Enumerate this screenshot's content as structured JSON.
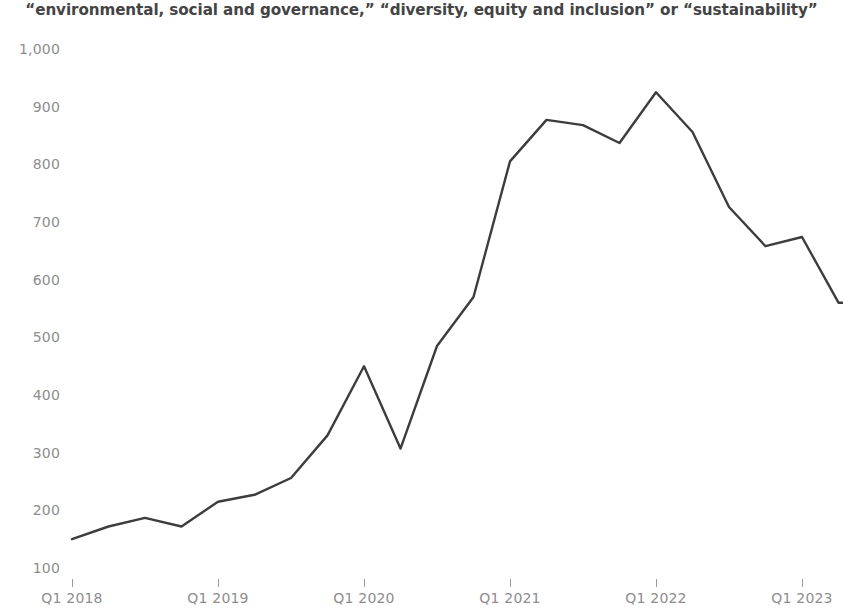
{
  "chart_data": {
    "type": "line",
    "title": "“environmental, social and governance,” “diversity, equity and inclusion” or “sustainability”",
    "subtitle": "",
    "xlabel": "",
    "ylabel": "",
    "ylim": [
      100,
      1000
    ],
    "grid": false,
    "legend": "none",
    "line_color": "#3d3d3d",
    "text_color": "#8d8d8d",
    "title_color": "#444444",
    "y_ticks": [
      "1,000",
      "900",
      "800",
      "700",
      "600",
      "500",
      "400",
      "300",
      "200",
      "100"
    ],
    "y_tick_values": [
      1000,
      900,
      800,
      700,
      600,
      500,
      400,
      300,
      200,
      100
    ],
    "x_ticks": [
      "Q1 2018",
      "Q1 2019",
      "Q1 2020",
      "Q1 2021",
      "Q1 2022",
      "Q1 2023"
    ],
    "x_tick_index": [
      0,
      4,
      8,
      12,
      16,
      20
    ],
    "categories": [
      "Q1 2018",
      "Q2 2018",
      "Q3 2018",
      "Q4 2018",
      "Q1 2019",
      "Q2 2019",
      "Q3 2019",
      "Q4 2019",
      "Q1 2020",
      "Q2 2020",
      "Q3 2020",
      "Q4 2020",
      "Q1 2021",
      "Q2 2021",
      "Q3 2021",
      "Q4 2021",
      "Q1 2022",
      "Q2 2022",
      "Q3 2022",
      "Q4 2022",
      "Q1 2023",
      "Q2 2023",
      "Q3 2023"
    ],
    "values": [
      150,
      172,
      187,
      172,
      215,
      227,
      256,
      330,
      450,
      307,
      485,
      570,
      805,
      877,
      868,
      837,
      925,
      856,
      726,
      658,
      674,
      560,
      560
    ],
    "series": [
      {
        "name": "mentions",
        "values": [
          150,
          172,
          187,
          172,
          215,
          227,
          256,
          330,
          450,
          307,
          485,
          570,
          805,
          877,
          868,
          837,
          925,
          856,
          726,
          658,
          674,
          560,
          560
        ]
      }
    ]
  }
}
